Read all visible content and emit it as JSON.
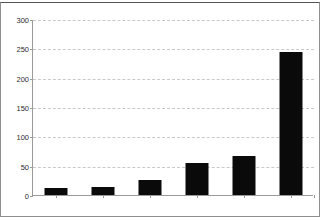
{
  "chart_data": {
    "type": "bar",
    "title": "",
    "xlabel": "",
    "ylabel": "",
    "categories": [
      "1980-84",
      "1985-89",
      "1990-94",
      "1995-99",
      "2000-04",
      "2005-09"
    ],
    "values": [
      12,
      14,
      26,
      54,
      67,
      244
    ],
    "ylim": [
      0,
      300
    ],
    "yticks": [
      0,
      50,
      100,
      150,
      200,
      250,
      300
    ],
    "ytick_labels": [
      "0",
      "50",
      "100",
      "150",
      "200",
      "250",
      "300"
    ],
    "grid": true,
    "grid_axis": "y",
    "grid_style": "dashed",
    "legend": false,
    "series": [
      {
        "name": "count",
        "values": [
          12,
          14,
          26,
          54,
          67,
          244
        ]
      }
    ],
    "colors": {
      "bar": "#0a0a0a",
      "grid": "#c9c9c9",
      "axis": "#9a9a9a",
      "text": "#2e2e2e",
      "background": "#ffffff",
      "frame": "#8f8f8f"
    }
  }
}
